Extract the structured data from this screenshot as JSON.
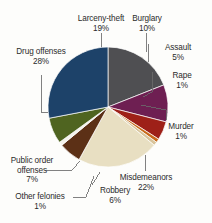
{
  "chart_data": {
    "type": "pie",
    "title": "",
    "subtitle": "",
    "xlabel": "",
    "ylabel": "",
    "legend_position": "none",
    "grid": false,
    "value_unit": "%",
    "total": 100,
    "start_angle_deg": 0,
    "direction": "clockwise",
    "categories": [
      "Larceny-theft",
      "Burglary",
      "Assault",
      "Rape",
      "Murder",
      "Misdemeanors",
      "Robbery",
      "Other felonies",
      "Public order offenses",
      "Drug offenses"
    ],
    "values": [
      19,
      10,
      5,
      1,
      1,
      22,
      6,
      1,
      7,
      28
    ],
    "colors": [
      "#4f4f52",
      "#6e1f52",
      "#9e2018",
      "#c86a1c",
      "#d8c49a",
      "#e8dfc2",
      "#5c3016",
      "#f4f2ec",
      "#4f6420",
      "#1d4269"
    ],
    "slices": [
      {
        "label": "Larceny-theft",
        "value": 19,
        "display_value": "19%",
        "color": "#4f4f52"
      },
      {
        "label": "Burglary",
        "value": 10,
        "display_value": "10%",
        "color": "#6e1f52"
      },
      {
        "label": "Assault",
        "value": 5,
        "display_value": "5%",
        "color": "#9e2018"
      },
      {
        "label": "Rape",
        "value": 1,
        "display_value": "1%",
        "color": "#c86a1c"
      },
      {
        "label": "Murder",
        "value": 1,
        "display_value": "1%",
        "color": "#d8c49a"
      },
      {
        "label": "Misdemeanors",
        "value": 22,
        "display_value": "22%",
        "color": "#e8dfc2"
      },
      {
        "label": "Robbery",
        "value": 6,
        "display_value": "6%",
        "color": "#5c3016"
      },
      {
        "label": "Other felonies",
        "value": 1,
        "display_value": "1%",
        "color": "#f4f2ec"
      },
      {
        "label": "Public order offenses",
        "value": 7,
        "display_value": "7%",
        "color": "#4f6420"
      },
      {
        "label": "Drug offenses",
        "value": 28,
        "display_value": "28%",
        "color": "#1d4269"
      }
    ]
  },
  "labels": {
    "larceny_theft": {
      "name": "Larceny-theft",
      "pct": "19%"
    },
    "burglary": {
      "name": "Burglary",
      "pct": "10%"
    },
    "assault": {
      "name": "Assault",
      "pct": "5%"
    },
    "rape": {
      "name": "Rape",
      "pct": "1%"
    },
    "murder": {
      "name": "Murder",
      "pct": "1%"
    },
    "misdemeanors": {
      "name": "Misdemeanors",
      "pct": "22%"
    },
    "robbery": {
      "name": "Robbery",
      "pct": "6%"
    },
    "other_felonies": {
      "name": "Other felonies",
      "pct": "1%"
    },
    "public_order": {
      "name": "Public order",
      "name2": "offenses",
      "pct": "7%"
    },
    "drug_offenses": {
      "name": "Drug offenses",
      "pct": "28%"
    }
  }
}
